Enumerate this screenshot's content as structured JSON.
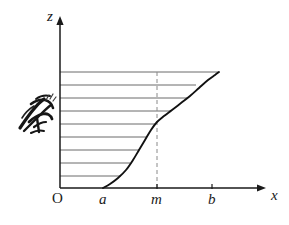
{
  "figure": {
    "title": "",
    "background_color": "#ffffff",
    "ink_color": "#1a1a1a",
    "hatch_color": "#6b6b6b",
    "dash_color": "#8a8a8a",
    "curve_color": "#111111"
  },
  "axes": {
    "vertical": {
      "label": "z",
      "name": "z-axis",
      "x": 60,
      "y_top": 16,
      "y_bottom": 188,
      "label_x": 47,
      "label_y": 21
    },
    "horizontal": {
      "label": "x",
      "name": "x-axis",
      "y": 188,
      "x_left": 60,
      "x_right": 266,
      "label_x": 271,
      "label_y": 200
    },
    "origin": {
      "label": "O",
      "x": 52,
      "y": 203
    }
  },
  "ticks": [
    {
      "label": "a",
      "x": 103,
      "label_x": 99,
      "label_y": 204,
      "has_tick_mark": false
    },
    {
      "label": "m",
      "x": 157,
      "label_x": 151,
      "label_y": 204,
      "has_tick_mark": true
    },
    {
      "label": "b",
      "x": 212,
      "label_x": 208,
      "label_y": 204,
      "has_tick_mark": true
    }
  ],
  "dashed_line": {
    "name": "dashed-line-at-m",
    "x": 157,
    "y_top": 72,
    "y_bottom": 188
  },
  "chart_data": {
    "type": "line",
    "title": "",
    "xlabel": "x",
    "ylabel": "z",
    "grid": false,
    "legend": null,
    "curve_name": "cumulative-ogive-curve",
    "xlim": [
      60,
      266
    ],
    "ylim": [
      188,
      72
    ],
    "x_named_points": {
      "a": 103,
      "m": 157,
      "b": 212
    },
    "points": [
      {
        "x": 103,
        "y": 188
      },
      {
        "x": 110,
        "y": 184
      },
      {
        "x": 118,
        "y": 178
      },
      {
        "x": 126,
        "y": 170
      },
      {
        "x": 133,
        "y": 160
      },
      {
        "x": 139,
        "y": 150
      },
      {
        "x": 145,
        "y": 140
      },
      {
        "x": 151,
        "y": 130
      },
      {
        "x": 157,
        "y": 122
      },
      {
        "x": 164,
        "y": 116
      },
      {
        "x": 172,
        "y": 110
      },
      {
        "x": 181,
        "y": 103
      },
      {
        "x": 190,
        "y": 96
      },
      {
        "x": 199,
        "y": 88
      },
      {
        "x": 208,
        "y": 80
      },
      {
        "x": 215,
        "y": 75
      },
      {
        "x": 219,
        "y": 72
      }
    ],
    "hatch_lines": [
      {
        "y": 72,
        "x_start": 60,
        "x_end": 219
      },
      {
        "y": 85,
        "x_start": 60,
        "x_end": 196
      },
      {
        "y": 98,
        "x_start": 60,
        "x_end": 187
      },
      {
        "y": 111,
        "x_start": 60,
        "x_end": 170
      },
      {
        "y": 124,
        "x_start": 60,
        "x_end": 156
      },
      {
        "y": 137,
        "x_start": 60,
        "x_end": 147
      },
      {
        "y": 150,
        "x_start": 60,
        "x_end": 139
      },
      {
        "y": 163,
        "x_start": 60,
        "x_end": 130
      },
      {
        "y": 176,
        "x_start": 60,
        "x_end": 121
      }
    ]
  },
  "annotation": {
    "name": "handwritten-ink-scribble",
    "x": 16,
    "y": 96,
    "width": 42,
    "height": 40,
    "description": "dark handwritten ink mark / scribble annotation at left margin"
  }
}
